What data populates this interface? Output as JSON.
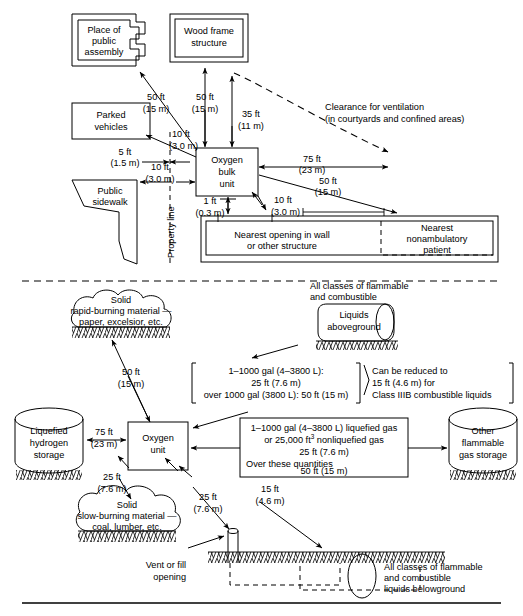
{
  "figure": {
    "sections": [
      "aboveground site plan",
      "oxygen unit clearance plan"
    ]
  },
  "top_section": {
    "facilities": [
      {
        "id": "place-of-public-assembly",
        "label_lines": [
          "Place of",
          "public",
          "assembly"
        ]
      },
      {
        "id": "wood-frame-structure",
        "label_lines": [
          "Wood frame",
          "structure"
        ]
      },
      {
        "id": "parked-vehicles",
        "label_lines": [
          "Parked",
          "vehicles"
        ]
      },
      {
        "id": "public-sidewalk",
        "label_lines": [
          "Public",
          "sidewalk"
        ]
      },
      {
        "id": "oxygen-bulk-unit",
        "label_lines": [
          "Oxygen",
          "bulk",
          "unit"
        ]
      },
      {
        "id": "nearest-opening",
        "label_lines": [
          "Nearest opening in wall",
          "or other structure"
        ]
      },
      {
        "id": "nearest-nonambulatory-patient",
        "label_lines": [
          "Nearest",
          "nonambulatory",
          "patient"
        ]
      }
    ],
    "property_line_label": "Property line",
    "ventilation_note": [
      "Clearance for ventilation",
      "(in courtyards and confined areas)"
    ],
    "dimensions": [
      {
        "id": "dim-assembly",
        "ft": "50 ft",
        "m": "(15 m)"
      },
      {
        "id": "dim-wood-frame",
        "ft": "50 ft",
        "m": "(15 m)"
      },
      {
        "id": "dim-ventilation-35",
        "ft": "35 ft",
        "m": "(11 m)"
      },
      {
        "id": "dim-parked-vehicles",
        "ft": "10 ft",
        "m": "(3.0 m)"
      },
      {
        "id": "dim-property-line-5",
        "ft": "5 ft",
        "m": "(1.5 m)"
      },
      {
        "id": "dim-sidewalk-10",
        "ft": "10 ft",
        "m": "(3.0 m)"
      },
      {
        "id": "dim-wall-1ft",
        "ft": "1 ft",
        "m": "(0.3 m)"
      },
      {
        "id": "dim-opening-10",
        "ft": "10 ft",
        "m": "(3.0 m)"
      },
      {
        "id": "dim-ventilation-75",
        "ft": "75 ft",
        "m": "(23 m)"
      },
      {
        "id": "dim-patient-50",
        "ft": "50 ft",
        "m": "(15 m)"
      }
    ]
  },
  "bottom_section": {
    "facilities": [
      {
        "id": "solid-rapid-burning",
        "label_lines": [
          "Solid",
          "rapid-burning material —",
          "paper, excelsior, etc."
        ]
      },
      {
        "id": "liquids-aboveground",
        "label_lines": [
          "Liquids",
          "aboveground"
        ],
        "caption_lines": [
          "All classes of flammable",
          "and combustible"
        ]
      },
      {
        "id": "liquefied-hydrogen-storage",
        "label_lines": [
          "Liquefied",
          "hydrogen",
          "storage"
        ]
      },
      {
        "id": "oxygen-unit",
        "label_lines": [
          "Oxygen",
          "unit"
        ]
      },
      {
        "id": "other-flammable-gas-storage",
        "label_lines": [
          "Other",
          "flammable",
          "gas storage"
        ]
      },
      {
        "id": "solid-slow-burning",
        "label_lines": [
          "Solid",
          "slow-burning material —",
          "coal, lumber, etc."
        ]
      },
      {
        "id": "vent-or-fill-opening",
        "label_lines": [
          "Vent or fill",
          "opening"
        ]
      },
      {
        "id": "liquids-belowground",
        "label_lines": [
          "All classes of flammable",
          "and combustible",
          "liquids belowground"
        ]
      }
    ],
    "notes": [
      {
        "id": "note-liquids-aboveground",
        "lines": [
          "1–1000 gal (4–3800 L):",
          "25 ft (7.6 m)",
          "over 1000 gal (3800 L): 50 ft (15 m)"
        ]
      },
      {
        "id": "note-class-iiib",
        "lines": [
          "Can be reduced to",
          "15 ft  (4.6 m) for",
          "Class IIIB combustible liquids"
        ]
      },
      {
        "id": "note-flammable-gas",
        "lines_rich": [
          {
            "text": "1–1000 gal (4–3800 L) liquefied gas",
            "align": "center"
          },
          {
            "text": "or 25,000 ft",
            "sup": "3",
            "text_after": " nonliquefied gas",
            "align": "center"
          },
          {
            "text": "25 ft (7.6 m)",
            "align": "center"
          },
          {
            "text": "Over these quantities",
            "align": "left"
          },
          {
            "text": "50 ft (15 m)",
            "align": "center"
          }
        ]
      }
    ],
    "dimensions": [
      {
        "id": "dim-rapid-burning-50",
        "ft": "50 ft",
        "m": "(15 m)"
      },
      {
        "id": "dim-hydrogen-75",
        "ft": "75 ft",
        "m": "(23 m)"
      },
      {
        "id": "dim-slow-burning-25",
        "ft": "25 ft",
        "m": "(7.6 m)"
      },
      {
        "id": "dim-vent-25",
        "ft": "25 ft",
        "m": "(7.6 m)"
      },
      {
        "id": "dim-belowground-15",
        "ft": "15 ft",
        "m": "(4.6 m)"
      }
    ]
  },
  "colors": {
    "ink": "#000000",
    "paper": "#ffffff"
  }
}
